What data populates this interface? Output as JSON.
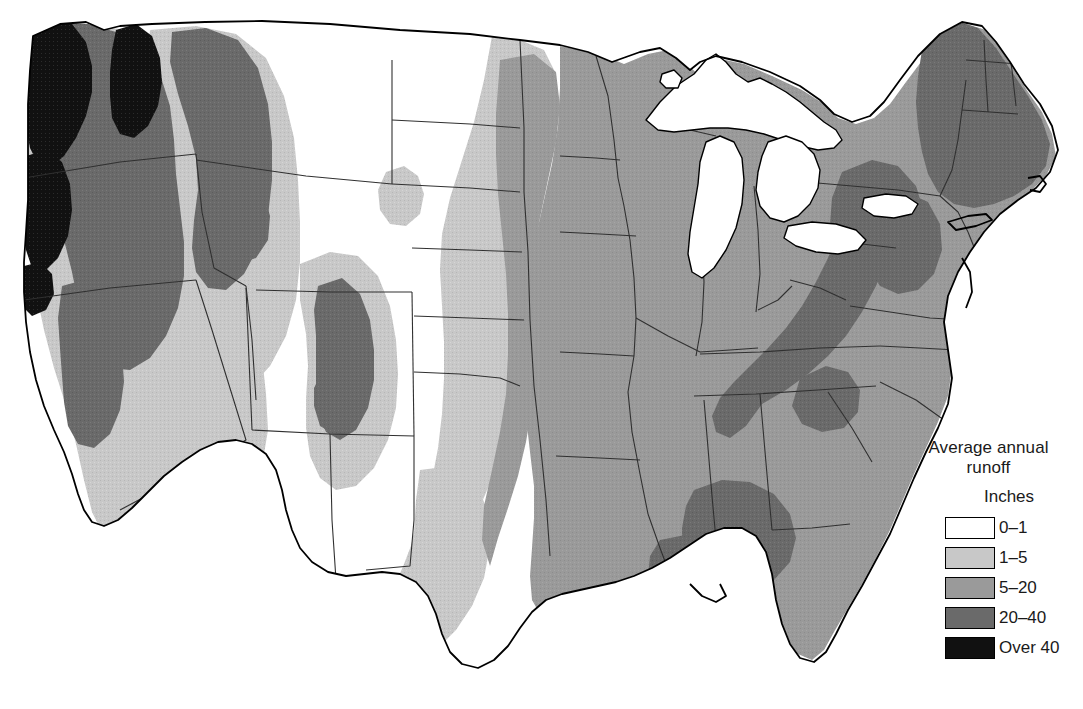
{
  "figure": {
    "type": "choropleth-map",
    "region": "Contiguous United States",
    "background_color": "#ffffff",
    "outline_color": "#000000"
  },
  "legend": {
    "title_line1": "Average annual",
    "title_line2": "runoff",
    "units": "Inches",
    "classes": [
      {
        "label": "0–1",
        "color": "#ffffff",
        "min": 0,
        "max": 1
      },
      {
        "label": "1–5",
        "color": "#c8c8c8",
        "min": 1,
        "max": 5
      },
      {
        "label": "5–20",
        "color": "#9a9a9a",
        "min": 5,
        "max": 20
      },
      {
        "label": "20–40",
        "color": "#6a6a6a",
        "min": 20,
        "max": 40
      },
      {
        "label": "Over 40",
        "color": "#111111",
        "min": 40,
        "max": null
      }
    ]
  },
  "map_notes": {
    "lakes_color": "#ffffff",
    "state_border_color": "#2a2a2a",
    "coast_border_color": "#000000"
  }
}
